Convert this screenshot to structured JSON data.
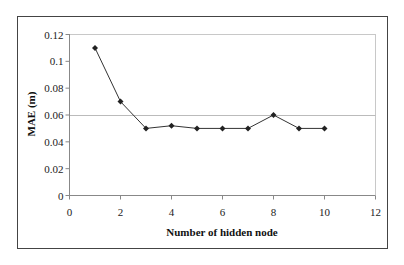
{
  "chart_data": {
    "type": "line",
    "title": "",
    "xlabel": "Number of hidden node",
    "ylabel": "MAE (m)",
    "x": [
      1,
      2,
      3,
      4,
      5,
      6,
      7,
      8,
      9,
      10
    ],
    "series": [
      {
        "name": "MAE",
        "values": [
          0.11,
          0.07,
          0.05,
          0.052,
          0.05,
          0.05,
          0.05,
          0.06,
          0.05,
          0.05
        ],
        "color": "#333333",
        "marker": "diamond"
      }
    ],
    "xlim": [
      0,
      12
    ],
    "ylim": [
      0,
      0.12
    ],
    "xticks": [
      0,
      2,
      4,
      6,
      8,
      10,
      12
    ],
    "yticks": [
      0,
      0.02,
      0.04,
      0.06,
      0.08,
      0.1,
      0.12
    ],
    "xtick_labels": [
      "0",
      "2",
      "4",
      "6",
      "8",
      "10",
      "12"
    ],
    "ytick_labels": [
      "0",
      "0.02",
      "0.04",
      "0.06",
      "0.08",
      "0.1",
      "0.12"
    ],
    "grid": {
      "horizontal_lines_at": [
        0.06
      ],
      "color": "#bbbbbb"
    },
    "legend": null
  }
}
